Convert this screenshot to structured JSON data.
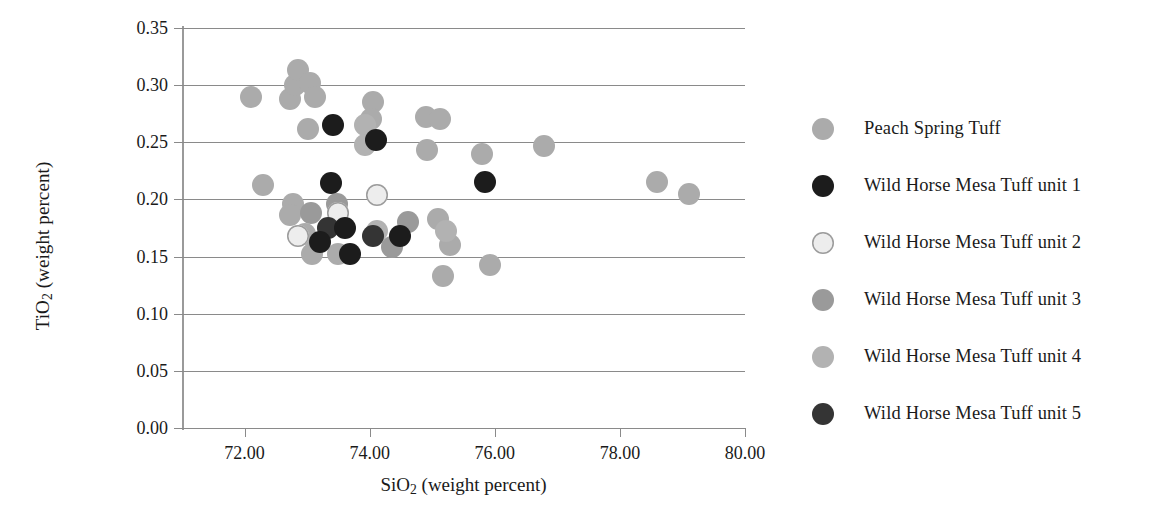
{
  "chart_data": {
    "type": "scatter",
    "title": "",
    "xlabel": "SiO2 (weight percent)",
    "ylabel": "TiO2 (weight percent)",
    "xlabel_html": "SiO<sub>2</sub> (weight percent)",
    "ylabel_html": "TiO<sub>2</sub> (weight percent)",
    "xlim": [
      71.0,
      80.0
    ],
    "ylim": [
      0.0,
      0.35
    ],
    "xticks": [
      72.0,
      74.0,
      76.0,
      78.0,
      80.0
    ],
    "xticklabels": [
      "72.00",
      "74.00",
      "76.00",
      "78.00",
      "80.00"
    ],
    "yticks": [
      0.0,
      0.05,
      0.1,
      0.15,
      0.2,
      0.25,
      0.3,
      0.35
    ],
    "yticklabels": [
      "0.00",
      "0.05",
      "0.10",
      "0.15",
      "0.20",
      "0.25",
      "0.30",
      "0.35"
    ],
    "grid": "horizontal",
    "legend_position": "right",
    "marker": "circle",
    "marker_size_px": 22,
    "series": [
      {
        "name": "Peach Spring Tuff",
        "color": "#ababab",
        "edge_color": "#ababab",
        "points": [
          [
            72.1,
            0.29
          ],
          [
            72.3,
            0.213
          ],
          [
            72.72,
            0.288
          ],
          [
            72.8,
            0.3
          ],
          [
            72.86,
            0.313
          ],
          [
            73.05,
            0.302
          ],
          [
            73.12,
            0.29
          ],
          [
            73.02,
            0.262
          ],
          [
            72.78,
            0.196
          ],
          [
            72.72,
            0.186
          ],
          [
            72.96,
            0.17
          ],
          [
            73.08,
            0.152
          ],
          [
            73.5,
            0.152
          ],
          [
            74.05,
            0.285
          ],
          [
            74.02,
            0.27
          ],
          [
            74.9,
            0.272
          ],
          [
            75.12,
            0.27
          ],
          [
            74.92,
            0.243
          ],
          [
            75.8,
            0.24
          ],
          [
            76.78,
            0.247
          ],
          [
            75.1,
            0.183
          ],
          [
            75.28,
            0.16
          ],
          [
            75.18,
            0.133
          ],
          [
            75.93,
            0.143
          ],
          [
            78.6,
            0.215
          ],
          [
            79.1,
            0.205
          ]
        ]
      },
      {
        "name": "Wild Horse Mesa Tuff unit 1",
        "color": "#1c1c1c",
        "edge_color": "#1c1c1c",
        "points": [
          [
            73.42,
            0.265
          ],
          [
            74.1,
            0.252
          ],
          [
            73.38,
            0.214
          ],
          [
            73.2,
            0.163
          ],
          [
            73.6,
            0.175
          ],
          [
            73.68,
            0.152
          ],
          [
            74.48,
            0.168
          ],
          [
            75.85,
            0.215
          ]
        ]
      },
      {
        "name": "Wild Horse Mesa Tuff unit 2",
        "color": "#ededed",
        "edge_color": "#9c9c9c",
        "points": [
          [
            74.12,
            0.204
          ],
          [
            73.5,
            0.188
          ],
          [
            72.85,
            0.168
          ]
        ]
      },
      {
        "name": "Wild Horse Mesa Tuff unit 3",
        "color": "#9a9a9a",
        "edge_color": "#9a9a9a",
        "points": [
          [
            73.48,
            0.196
          ],
          [
            73.06,
            0.188
          ],
          [
            74.62,
            0.18
          ],
          [
            74.35,
            0.158
          ]
        ]
      },
      {
        "name": "Wild Horse Mesa Tuff unit 4",
        "color": "#b2b2b2",
        "edge_color": "#b2b2b2",
        "points": [
          [
            73.92,
            0.265
          ],
          [
            73.92,
            0.248
          ],
          [
            74.12,
            0.172
          ],
          [
            75.22,
            0.172
          ]
        ]
      },
      {
        "name": "Wild Horse Mesa Tuff unit 5",
        "color": "#343434",
        "edge_color": "#343434",
        "points": [
          [
            73.34,
            0.175
          ],
          [
            74.05,
            0.168
          ]
        ]
      }
    ]
  },
  "legend": {
    "items": [
      {
        "label": "Peach Spring Tuff",
        "color": "#ababab",
        "edge": "#ababab"
      },
      {
        "label": "Wild Horse Mesa Tuff unit 1",
        "color": "#1c1c1c",
        "edge": "#1c1c1c"
      },
      {
        "label": "Wild Horse Mesa Tuff unit 2",
        "color": "#ededed",
        "edge": "#9c9c9c"
      },
      {
        "label": "Wild Horse Mesa Tuff unit 3",
        "color": "#9a9a9a",
        "edge": "#9a9a9a"
      },
      {
        "label": "Wild Horse Mesa Tuff unit 4",
        "color": "#b2b2b2",
        "edge": "#b2b2b2"
      },
      {
        "label": "Wild Horse Mesa Tuff unit 5",
        "color": "#343434",
        "edge": "#343434"
      }
    ]
  },
  "colors": {
    "background": "#ffffff",
    "gridline": "#8a8a8a",
    "axis": "#9a9a9a",
    "text": "#1a1a1a"
  }
}
